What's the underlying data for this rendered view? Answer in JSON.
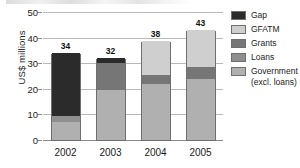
{
  "chart_data": {
    "type": "bar",
    "subtype": "stacked-bar",
    "title": "",
    "xlabel": "",
    "ylabel": "US$ millions",
    "ylim": [
      0,
      50
    ],
    "yticks": [
      0,
      10,
      20,
      30,
      40,
      50
    ],
    "ytick_labels": [
      "0",
      "10",
      "20",
      "30",
      "40",
      "50"
    ],
    "grid": "horizontal",
    "legend_position": "right",
    "categories": [
      "2002",
      "2003",
      "2004",
      "2005"
    ],
    "bar_total_labels": [
      "34",
      "32",
      "38",
      "43"
    ],
    "totals": [
      34,
      32,
      38.5,
      43
    ],
    "stack_order_bottom_to_top": [
      "Government (excl. loans)",
      "Loans",
      "Grants",
      "GFATM",
      "Gap"
    ],
    "series": [
      {
        "name": "Government (excl. loans)",
        "color": "#b0b0b0",
        "values": [
          7,
          19.5,
          22,
          24
        ]
      },
      {
        "name": "Loans",
        "color": "#8f8f8f",
        "values": [
          2.5,
          0,
          0,
          0
        ]
      },
      {
        "name": "Grants",
        "color": "#767676",
        "values": [
          0,
          10.5,
          3.5,
          4.5
        ]
      },
      {
        "name": "GFATM",
        "color": "#cfcfcf",
        "values": [
          0,
          0,
          13,
          14.5
        ]
      },
      {
        "name": "Gap",
        "color": "#2b2b2b",
        "values": [
          24.5,
          2,
          0,
          0
        ]
      }
    ],
    "legend_entries": [
      {
        "label": "Gap",
        "sublabel": "",
        "color": "#2b2b2b"
      },
      {
        "label": "GFATM",
        "sublabel": "",
        "color": "#cfcfcf"
      },
      {
        "label": "Grants",
        "sublabel": "",
        "color": "#767676"
      },
      {
        "label": "Loans",
        "sublabel": "",
        "color": "#8f8f8f"
      },
      {
        "label": "Government",
        "sublabel": "(excl. loans)",
        "color": "#b0b0b0"
      }
    ]
  },
  "axis": {
    "y_label_text": "US$ millions"
  },
  "colors": {
    "gridline": "#b9b9b9",
    "axis": "#8a8a8a",
    "bar_outline": "#6f6f6f",
    "text": "#1b1b1b",
    "background": "#ffffff"
  }
}
